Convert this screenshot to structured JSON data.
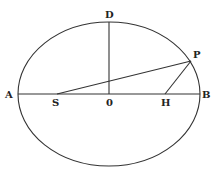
{
  "diagram": {
    "type": "ellipse-geometry",
    "colors": {
      "stroke": "#333333",
      "label": "#222222",
      "background": "#ffffff"
    },
    "ellipse": {
      "cx": 109,
      "cy": 94,
      "rx": 91,
      "ry": 72
    },
    "points": {
      "A": {
        "label": "A",
        "x": 18,
        "y": 94
      },
      "B": {
        "label": "B",
        "x": 200,
        "y": 94
      },
      "D": {
        "label": "D",
        "x": 109,
        "y": 22
      },
      "O": {
        "label": "0",
        "x": 109,
        "y": 94
      },
      "S": {
        "label": "S",
        "x": 57,
        "y": 94
      },
      "H": {
        "label": "H",
        "x": 165,
        "y": 94
      },
      "P": {
        "label": "P",
        "x": 191,
        "y": 61
      }
    },
    "segments": [
      {
        "name": "major-axis",
        "from": "A",
        "to": "B"
      },
      {
        "name": "semi-minor-axis",
        "from": "O",
        "to": "D"
      },
      {
        "name": "focal-radius-SP",
        "from": "S",
        "to": "P"
      },
      {
        "name": "focal-radius-HP",
        "from": "H",
        "to": "P"
      }
    ]
  }
}
